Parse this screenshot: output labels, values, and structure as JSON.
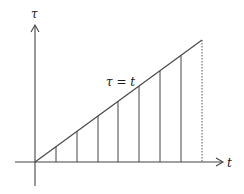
{
  "diagram": {
    "title": "",
    "axes": {
      "vertical_label": "τ",
      "horizontal_label": "t"
    },
    "line_label": "τ = t",
    "colors": {
      "stroke": "#444444",
      "text": "#1a1a1a",
      "background": "#ffffff"
    },
    "geometry": {
      "origin": [
        35,
        162
      ],
      "diagonal_end": [
        202,
        40
      ],
      "vertical_lines_x": [
        56,
        77,
        98,
        118,
        139,
        160,
        181
      ],
      "dotted_line_x": 202
    }
  }
}
